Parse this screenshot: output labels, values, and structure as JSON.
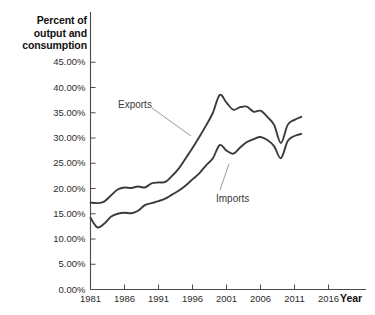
{
  "chart_data": {
    "type": "line",
    "title": "",
    "xlabel": "Year",
    "ylabel": "Percent of\noutput and\nconsumption",
    "xlim": [
      1981,
      2018
    ],
    "ylim": [
      0,
      47
    ],
    "grid": false,
    "legend_position": "inline-annotations",
    "x_tick_labels": [
      "1981",
      "1986",
      "1991",
      "1996",
      "2001",
      "2006",
      "2011",
      "2016"
    ],
    "x_tick_values": [
      1981,
      1986,
      1991,
      1996,
      2001,
      2006,
      2011,
      2016
    ],
    "y_tick_labels": [
      "0.00%",
      "5.00%",
      "10.00%",
      "15.00%",
      "20.00%",
      "25.00%",
      "30.00%",
      "35.00%",
      "40.00%",
      "45.00%"
    ],
    "y_tick_values": [
      0,
      5,
      10,
      15,
      20,
      25,
      30,
      35,
      40,
      45
    ],
    "line_color": "#3b3b3b",
    "axis_color": "#4a4a4a",
    "x": [
      1981,
      1982,
      1983,
      1984,
      1985,
      1986,
      1987,
      1988,
      1989,
      1990,
      1991,
      1992,
      1993,
      1994,
      1995,
      1996,
      1997,
      1998,
      1999,
      2000,
      2001,
      2002,
      2003,
      2004,
      2005,
      2006,
      2007,
      2008,
      2009,
      2010,
      2011,
      2012
    ],
    "series": [
      {
        "name": "Exports",
        "values": [
          17.2,
          17.1,
          17.4,
          18.6,
          19.8,
          20.2,
          20.1,
          20.4,
          20.2,
          21.0,
          21.2,
          21.3,
          22.5,
          24.0,
          26.0,
          28.0,
          30.2,
          32.5,
          35.0,
          38.5,
          37.0,
          35.6,
          36.1,
          36.2,
          35.2,
          35.4,
          34.2,
          32.6,
          29.0,
          32.6,
          33.6,
          34.2
        ]
      },
      {
        "name": "Imports",
        "values": [
          14.2,
          12.3,
          13.0,
          14.4,
          15.0,
          15.2,
          15.1,
          15.6,
          16.7,
          17.1,
          17.5,
          18.0,
          18.8,
          19.6,
          20.6,
          21.8,
          23.0,
          24.6,
          26.0,
          28.6,
          27.5,
          26.9,
          28.1,
          29.2,
          29.8,
          30.2,
          29.6,
          28.4,
          26.0,
          29.4,
          30.4,
          30.8
        ]
      }
    ],
    "annotations": [
      {
        "text": "Exports",
        "label_x": 118,
        "label_y": 99,
        "leader_from_x": 152,
        "leader_from_y": 108,
        "leader_to_x": 191,
        "leader_to_y": 136
      },
      {
        "text": "Imports",
        "label_x": 216,
        "label_y": 193,
        "leader_from_x": 220,
        "leader_from_y": 190,
        "leader_to_x": 229,
        "leader_to_y": 164
      }
    ]
  }
}
